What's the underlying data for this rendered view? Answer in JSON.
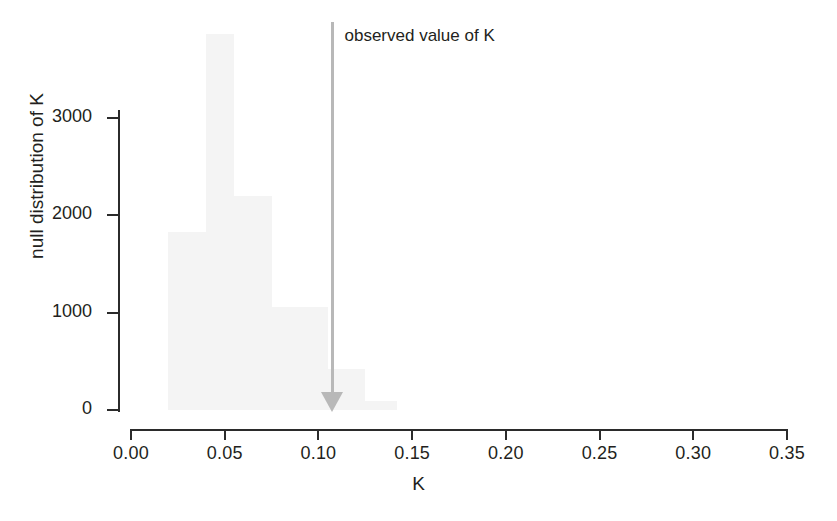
{
  "chart_data": {
    "type": "bar",
    "title": "",
    "subtitle": "",
    "xlabel": "K",
    "ylabel": "null distribution of K",
    "xlim": [
      0.0,
      0.35
    ],
    "ylim": [
      0,
      4000
    ],
    "grid": false,
    "legend": "none",
    "xticks": [
      "0.00",
      "0.05",
      "0.10",
      "0.15",
      "0.20",
      "0.25",
      "0.30",
      "0.35"
    ],
    "xtick_values": [
      0.0,
      0.05,
      0.1,
      0.15,
      0.2,
      0.25,
      0.3,
      0.35
    ],
    "yticks": [
      "0",
      "1000",
      "2000",
      "3000"
    ],
    "ytick_values": [
      0,
      1000,
      2000,
      3000
    ],
    "bar_color": "#f4f4f4",
    "axis_color": "#2b2b2b",
    "bins": [
      {
        "x0": 0.02,
        "x1": 0.04,
        "value": 1830
      },
      {
        "x0": 0.04,
        "x1": 0.055,
        "value": 3860
      },
      {
        "x0": 0.055,
        "x1": 0.075,
        "value": 2200
      },
      {
        "x0": 0.075,
        "x1": 0.105,
        "value": 1060
      },
      {
        "x0": 0.105,
        "x1": 0.125,
        "value": 420
      },
      {
        "x0": 0.125,
        "x1": 0.142,
        "value": 90
      }
    ],
    "annotations": [
      {
        "name": "observed-value-of-K",
        "text": "observed value of K",
        "x": 0.1075,
        "y_top": 4100,
        "y_bottom": 0,
        "color": "#b8b8b8",
        "marker": "down-arrow"
      }
    ]
  }
}
